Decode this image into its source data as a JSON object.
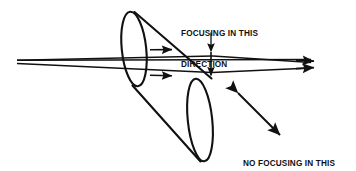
{
  "figure": {
    "background_color": "#ffffff",
    "ink_color": "#111111",
    "width": 356,
    "height": 171
  },
  "labels": {
    "focusing": {
      "line1": "FOCUSING IN THIS",
      "line2": "DIRECTION"
    },
    "no_focusing": {
      "line1": "NO FOCUSING IN THIS",
      "line2": "DIRECTION"
    }
  },
  "icons": {
    "leader_line": "leader-line-icon",
    "focus_arrow": "vertical-double-arrow-icon",
    "no_focus_arrow": "diagonal-double-arrow-icon",
    "ray_arrow": "ray-arrowhead-icon",
    "lens_front": "lens-ellipse-icon",
    "lens_back": "lens-ellipse-icon",
    "cone": "light-cone-icon"
  },
  "geometry": {
    "source_vertex": {
      "x": 17,
      "y": 62
    },
    "focus_vertex": {
      "x": 316,
      "y": 65
    },
    "front_ellipse": {
      "cx": 134,
      "cy": 49,
      "rx": 12,
      "ry": 38,
      "rotation": -6
    },
    "back_ellipse": {
      "cx": 200,
      "cy": 120,
      "rx": 12,
      "ry": 42,
      "rotation": -6
    },
    "waist": {
      "x": 211,
      "y_top": 56,
      "y_bottom": 72
    },
    "no_focus_arrow": {
      "x1": 237,
      "y1": 92,
      "x2": 281,
      "y2": 136
    }
  }
}
